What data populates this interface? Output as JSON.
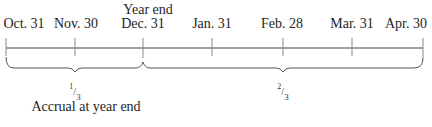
{
  "diagram": {
    "type": "timeline",
    "annotation_top": {
      "text": "Year end",
      "x": 148
    },
    "ticks": [
      {
        "label": "Oct. 31",
        "x": 6
      },
      {
        "label": "Nov. 30",
        "x": 75
      },
      {
        "label": "Dec. 31",
        "x": 143
      },
      {
        "label": "Jan. 31",
        "x": 212
      },
      {
        "label": "Feb. 28",
        "x": 283
      },
      {
        "label": "Mar. 31",
        "x": 352
      },
      {
        "label": "Apr. 30",
        "x": 423
      }
    ],
    "braces": [
      {
        "from": "Oct. 31",
        "to": "Dec. 31",
        "fraction_num": "1",
        "fraction_den": "3",
        "center_x": 75
      },
      {
        "from": "Dec. 31",
        "to": "Apr. 30",
        "fraction_num": "2",
        "fraction_den": "3",
        "center_x": 283
      }
    ],
    "caption": "Accrual at year end",
    "colors": {
      "axis": "#9a9a9a",
      "tick": "#8a8a8a",
      "brace": "#555555",
      "text": "#1e1e1e"
    }
  }
}
